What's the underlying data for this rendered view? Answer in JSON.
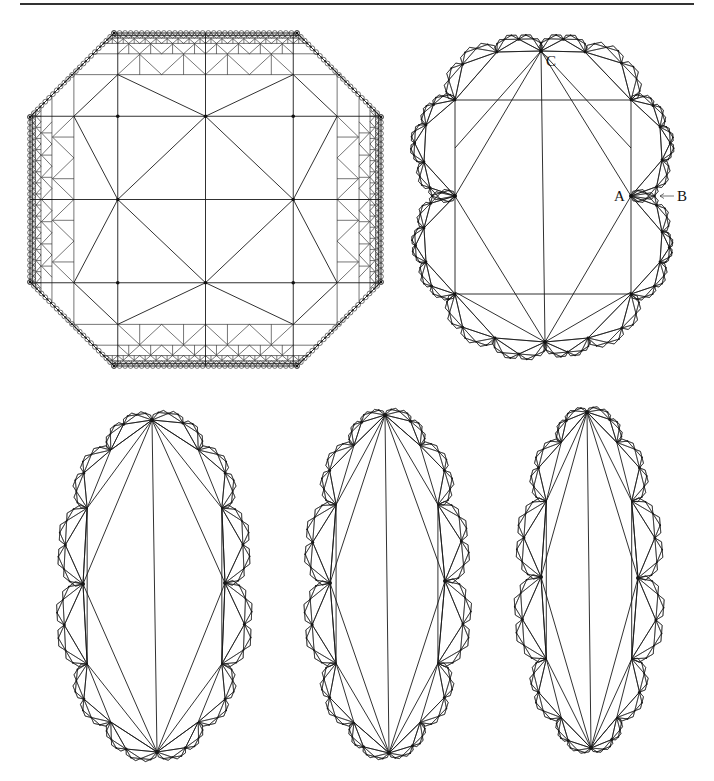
{
  "figure": {
    "panels": [
      {
        "id": "octagon",
        "kind": "octagon-grid",
        "bounds": {
          "left": 30,
          "right": 381,
          "top": 33,
          "bottom": 366
        },
        "corner_cut": 84
      },
      {
        "id": "scalloped-rectangle",
        "kind": "scalloped",
        "center": [
          543,
          197
        ],
        "top_node": [
          541,
          51
        ],
        "bottom_node": [
          545,
          342
        ],
        "inner_rect": {
          "left": 455,
          "right": 631,
          "top": 100,
          "bottom": 294
        },
        "side_nodes": [
          [
            455,
            196
          ],
          [
            631,
            196
          ]
        ],
        "labels": [
          {
            "text": "A",
            "x": 614,
            "y": 201
          },
          {
            "text": "B",
            "x": 677,
            "y": 201
          },
          {
            "text": "C",
            "x": 546,
            "y": 64
          }
        ]
      },
      {
        "id": "oval-wide",
        "kind": "oval",
        "top_node": [
          152,
          420
        ],
        "bottom_node": [
          157,
          752
        ],
        "half_width": 82,
        "side_nodes": [
          [
            83,
            584
          ],
          [
            225,
            583
          ]
        ]
      },
      {
        "id": "oval-medium",
        "kind": "oval",
        "top_node": [
          385,
          415
        ],
        "bottom_node": [
          389,
          753
        ],
        "half_width": 62,
        "side_nodes": [
          [
            330,
            583
          ],
          [
            445,
            581
          ]
        ]
      },
      {
        "id": "oval-narrow",
        "kind": "oval",
        "top_node": [
          587,
          412
        ],
        "bottom_node": [
          591,
          748
        ],
        "half_width": 52,
        "side_nodes": [
          [
            541,
            577
          ],
          [
            638,
            578
          ]
        ]
      }
    ]
  }
}
